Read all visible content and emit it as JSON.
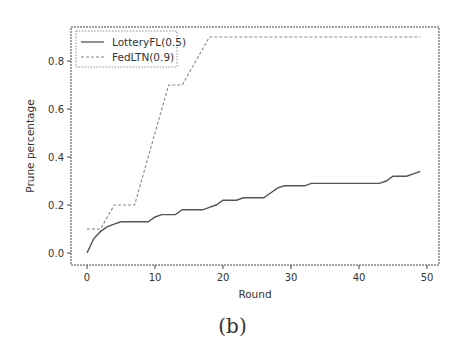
{
  "figure": {
    "caption": "(b)"
  },
  "chart_data": {
    "type": "line",
    "title": "",
    "xlabel": "Round",
    "ylabel": "Prune percentage",
    "xlim": [
      -2.5,
      52
    ],
    "ylim": [
      -0.05,
      0.95
    ],
    "xticks": [
      0,
      10,
      20,
      30,
      40,
      50
    ],
    "yticks": [
      0.0,
      0.2,
      0.4,
      0.6,
      0.8
    ],
    "xtick_labels": [
      "0",
      "10",
      "20",
      "30",
      "40",
      "50"
    ],
    "ytick_labels": [
      "0.0",
      "0.2",
      "0.4",
      "0.6",
      "0.8"
    ],
    "grid": false,
    "legend_position": "upper left",
    "x": [
      0,
      1,
      2,
      3,
      4,
      5,
      6,
      7,
      8,
      9,
      10,
      11,
      12,
      13,
      14,
      15,
      16,
      17,
      18,
      19,
      20,
      21,
      22,
      23,
      24,
      25,
      26,
      27,
      28,
      29,
      30,
      31,
      32,
      33,
      34,
      35,
      36,
      37,
      38,
      39,
      40,
      41,
      42,
      43,
      44,
      45,
      46,
      47,
      48,
      49
    ],
    "series": [
      {
        "name": "LotteryFL(0.5)",
        "style": "solid",
        "color": "#555555",
        "values": [
          0.0,
          0.06,
          0.09,
          0.11,
          0.12,
          0.13,
          0.13,
          0.13,
          0.13,
          0.13,
          0.15,
          0.16,
          0.16,
          0.16,
          0.18,
          0.18,
          0.18,
          0.18,
          0.19,
          0.2,
          0.22,
          0.22,
          0.22,
          0.23,
          0.23,
          0.23,
          0.23,
          0.25,
          0.27,
          0.28,
          0.28,
          0.28,
          0.28,
          0.29,
          0.29,
          0.29,
          0.29,
          0.29,
          0.29,
          0.29,
          0.29,
          0.29,
          0.29,
          0.29,
          0.3,
          0.32,
          0.32,
          0.32,
          0.33,
          0.34
        ]
      },
      {
        "name": "FedLTN(0.9)",
        "style": "dashed",
        "color": "#888888",
        "values": [
          0.1,
          0.1,
          0.1,
          0.15,
          0.2,
          0.2,
          0.2,
          0.2,
          0.3,
          0.4,
          0.5,
          0.6,
          0.7,
          0.7,
          0.7,
          0.75,
          0.8,
          0.85,
          0.9,
          0.9,
          0.9,
          0.9,
          0.9,
          0.9,
          0.9,
          0.9,
          0.9,
          0.9,
          0.9,
          0.9,
          0.9,
          0.9,
          0.9,
          0.9,
          0.9,
          0.9,
          0.9,
          0.9,
          0.9,
          0.9,
          0.9,
          0.9,
          0.9,
          0.9,
          0.9,
          0.9,
          0.9,
          0.9,
          0.9,
          0.9
        ]
      }
    ]
  }
}
